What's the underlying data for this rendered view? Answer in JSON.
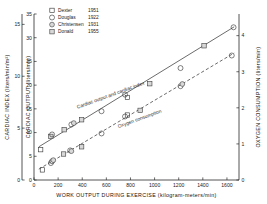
{
  "chart_data": {
    "type": "scatter",
    "title": "",
    "xlabel": "WORK OUTPUT DURING EXERCISE (kilogram-meters/min)",
    "xlim": [
      0,
      1700
    ],
    "xticks": [
      0,
      200,
      400,
      600,
      800,
      1000,
      1200,
      1400,
      1600
    ],
    "xticklabels": [
      "0",
      "200",
      "400",
      "600",
      "800",
      "1000",
      "1200",
      "1400",
      "1600"
    ],
    "axes": [
      {
        "id": "cardiac-index",
        "position": "left-outer",
        "label": "CARDIAC INDEX (liters/min/m²)",
        "lim": [
          0,
          16
        ],
        "ticks": [
          0,
          5,
          10,
          15
        ],
        "ticklabels": [
          "0",
          "5",
          "10",
          "15"
        ]
      },
      {
        "id": "cardiac-output",
        "position": "left-inner",
        "label": "CARDIAC OUTPUT (liters/min)",
        "lim": [
          0,
          35
        ],
        "ticks": [
          0,
          5,
          10,
          15,
          20,
          25,
          30,
          35
        ],
        "ticklabels": [
          "0",
          "5",
          "10",
          "15",
          "20",
          "25",
          "30",
          "35"
        ]
      },
      {
        "id": "oxygen-consumption",
        "position": "right",
        "label": "OXYGEN CONSUMPTION (liters/min)",
        "lim": [
          0,
          4.6
        ],
        "ticks": [
          0,
          1,
          2,
          3,
          4
        ],
        "ticklabels": [
          "0",
          "1",
          "2",
          "3",
          "4"
        ]
      }
    ],
    "annotations": [
      {
        "text": "Cardiac output and cardiac index",
        "x": 640,
        "y": 17.6,
        "rotation": -20
      },
      {
        "text": "Oxygen consumption",
        "x": 880,
        "y": 12.6,
        "rotation": -20
      }
    ],
    "grid": false,
    "legend_position": "top-left",
    "series": [
      {
        "name": "Cardiac output",
        "axis": "cardiac-output",
        "fit": {
          "type": "linear",
          "x": [
            40,
            1660
          ],
          "y": [
            7.0,
            32.3
          ],
          "style": "solid"
        },
        "points": [
          {
            "x": 55,
            "y": 6.4,
            "marker": "dexter"
          },
          {
            "x": 140,
            "y": 9.2,
            "marker": "donald"
          },
          {
            "x": 150,
            "y": 9.6,
            "marker": "douglas"
          },
          {
            "x": 250,
            "y": 10.6,
            "marker": "donald"
          },
          {
            "x": 310,
            "y": 11.7,
            "marker": "douglas"
          },
          {
            "x": 330,
            "y": 12.0,
            "marker": "christensen"
          },
          {
            "x": 395,
            "y": 12.7,
            "marker": "donald"
          },
          {
            "x": 560,
            "y": 14.5,
            "marker": "douglas"
          },
          {
            "x": 755,
            "y": 18.0,
            "marker": "douglas"
          },
          {
            "x": 775,
            "y": 17.4,
            "marker": "dexter"
          },
          {
            "x": 960,
            "y": 20.3,
            "marker": "donald"
          },
          {
            "x": 1215,
            "y": 23.6,
            "marker": "douglas"
          },
          {
            "x": 1410,
            "y": 28.3,
            "marker": "donald"
          },
          {
            "x": 1655,
            "y": 32.2,
            "marker": "douglas"
          }
        ]
      },
      {
        "name": "Oxygen consumption",
        "axis": "oxygen-consumption",
        "fit": {
          "type": "linear",
          "x": [
            40,
            1660
          ],
          "y": [
            0.3,
            3.52
          ],
          "style": "dashed"
        },
        "points": [
          {
            "x": 70,
            "y": 0.28,
            "marker": "dexter"
          },
          {
            "x": 140,
            "y": 0.47,
            "marker": "douglas"
          },
          {
            "x": 150,
            "y": 0.52,
            "marker": "douglas"
          },
          {
            "x": 160,
            "y": 0.55,
            "marker": "christensen"
          },
          {
            "x": 245,
            "y": 0.72,
            "marker": "donald"
          },
          {
            "x": 300,
            "y": 0.82,
            "marker": "douglas"
          },
          {
            "x": 310,
            "y": 0.8,
            "marker": "christensen"
          },
          {
            "x": 395,
            "y": 0.92,
            "marker": "donald"
          },
          {
            "x": 560,
            "y": 1.29,
            "marker": "douglas"
          },
          {
            "x": 755,
            "y": 1.76,
            "marker": "douglas"
          },
          {
            "x": 775,
            "y": 1.8,
            "marker": "dexter"
          },
          {
            "x": 880,
            "y": 1.93,
            "marker": "donald"
          },
          {
            "x": 1215,
            "y": 2.6,
            "marker": "douglas"
          },
          {
            "x": 1230,
            "y": 2.66,
            "marker": "christensen"
          },
          {
            "x": 1640,
            "y": 3.45,
            "marker": "douglas"
          }
        ]
      }
    ]
  },
  "legend": {
    "items": [
      {
        "marker": "dexter",
        "author": "Dexter",
        "year": "1951"
      },
      {
        "marker": "douglas",
        "author": "Douglas",
        "year": "1922"
      },
      {
        "marker": "christensen",
        "author": "Christensen",
        "year": "1931"
      },
      {
        "marker": "donald",
        "author": "Donald",
        "year": "1955"
      }
    ]
  },
  "colors": {
    "axis": "#2a2a2a",
    "marker": "#3c3c3c",
    "line": "#3a3a3a",
    "background": "#ffffff"
  }
}
